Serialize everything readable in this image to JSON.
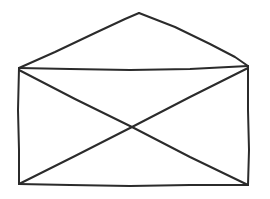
{
  "canvas": {
    "width": 270,
    "height": 199,
    "background_color": "#ffffff",
    "title": "Envelope line drawing"
  },
  "drawing": {
    "subject": "envelope",
    "style": "hand-drawn line sketch",
    "stroke_color": "#2b2b2b",
    "stroke_width": 2,
    "fill": "none",
    "shapes": [
      {
        "name": "envelope-body-left-edge",
        "type": "polyline",
        "points": "19,68 18,110 19,150 19,184"
      },
      {
        "name": "envelope-body-bottom-edge",
        "type": "polyline",
        "points": "19,184 70,185 130,186 190,185 248,185"
      },
      {
        "name": "envelope-body-right-edge",
        "type": "polyline",
        "points": "248,185 249,150 248,110 248,66"
      },
      {
        "name": "envelope-body-top-edge",
        "type": "polyline",
        "points": "248,66 190,69 130,70 70,69 19,68"
      },
      {
        "name": "envelope-flap-left-fold",
        "type": "polyline",
        "points": "19,68 55,52 95,33 125,19 139,13"
      },
      {
        "name": "envelope-flap-right-fold",
        "type": "polyline",
        "points": "139,13 175,27 210,44 235,57 248,66"
      },
      {
        "name": "envelope-diagonal-topleft-to-bottomright",
        "type": "polyline",
        "points": "19,70 75,99 132,127 190,157 248,185"
      },
      {
        "name": "envelope-diagonal-bottomleft-to-topright",
        "type": "polyline",
        "points": "19,184 75,156 132,127 190,97 248,68"
      }
    ]
  }
}
